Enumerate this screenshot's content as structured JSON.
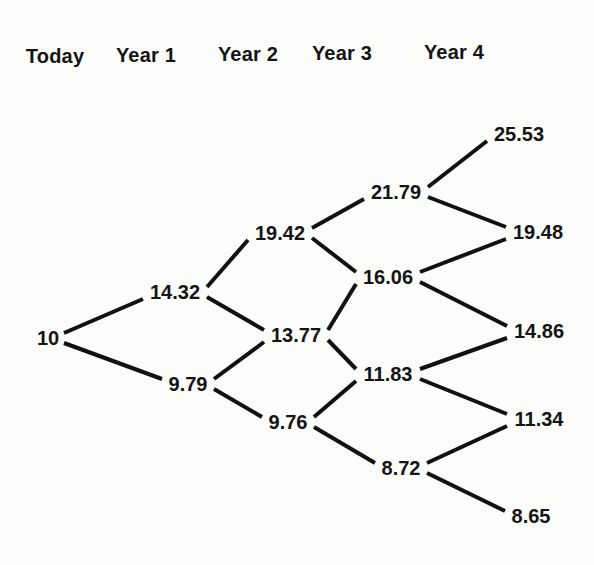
{
  "figure": {
    "background_color": "#fcfcfb",
    "line_color": "#111111",
    "text_color": "#141414",
    "line_width": 4
  },
  "columns": [
    {
      "label": "Today",
      "x": 55,
      "y": 56
    },
    {
      "label": "Year 1",
      "x": 146,
      "y": 55
    },
    {
      "label": "Year 2",
      "x": 248,
      "y": 54
    },
    {
      "label": "Year 3",
      "x": 342,
      "y": 53
    },
    {
      "label": "Year 4",
      "x": 454,
      "y": 52
    }
  ],
  "tree": {
    "type": "recombining-binomial-lattice",
    "root_value": 10,
    "values_by_period": [
      [
        10
      ],
      [
        14.32,
        9.79
      ],
      [
        19.42,
        13.77,
        9.76
      ],
      [
        21.79,
        16.06,
        11.83,
        8.72
      ],
      [
        25.53,
        19.48,
        14.86,
        11.34,
        8.65
      ]
    ],
    "nodes": [
      {
        "id": "t0",
        "label": "10",
        "period": 0,
        "x": 48,
        "y": 338,
        "hw": 13
      },
      {
        "id": "n1u",
        "label": "14.32",
        "period": 1,
        "x": 175,
        "y": 292,
        "hw": 29
      },
      {
        "id": "n1d",
        "label": "9.79",
        "period": 1,
        "x": 188,
        "y": 384,
        "hw": 23
      },
      {
        "id": "n2u",
        "label": "19.42",
        "period": 2,
        "x": 280,
        "y": 233,
        "hw": 29
      },
      {
        "id": "n2m",
        "label": "13.77",
        "period": 2,
        "x": 296,
        "y": 335,
        "hw": 29
      },
      {
        "id": "n2d",
        "label": "9.76",
        "period": 2,
        "x": 288,
        "y": 422,
        "hw": 23
      },
      {
        "id": "n3a",
        "label": "21.79",
        "period": 3,
        "x": 396,
        "y": 192,
        "hw": 29
      },
      {
        "id": "n3b",
        "label": "16.06",
        "period": 3,
        "x": 388,
        "y": 277,
        "hw": 29
      },
      {
        "id": "n3c",
        "label": "11.83",
        "period": 3,
        "x": 388,
        "y": 374,
        "hw": 29
      },
      {
        "id": "n3d",
        "label": "8.72",
        "period": 3,
        "x": 401,
        "y": 468,
        "hw": 23
      },
      {
        "id": "n4a",
        "label": "25.53",
        "period": 4,
        "x": 519,
        "y": 134,
        "hw": 29
      },
      {
        "id": "n4b",
        "label": "19.48",
        "period": 4,
        "x": 538,
        "y": 232,
        "hw": 29
      },
      {
        "id": "n4c",
        "label": "14.86",
        "period": 4,
        "x": 539,
        "y": 331,
        "hw": 29
      },
      {
        "id": "n4d",
        "label": "11.34",
        "period": 4,
        "x": 539,
        "y": 419,
        "hw": 29
      },
      {
        "id": "n4e",
        "label": "8.65",
        "period": 4,
        "x": 531,
        "y": 516,
        "hw": 23
      }
    ],
    "edges": [
      [
        "t0",
        "n1u"
      ],
      [
        "t0",
        "n1d"
      ],
      [
        "n1u",
        "n2u"
      ],
      [
        "n1u",
        "n2m"
      ],
      [
        "n1d",
        "n2m"
      ],
      [
        "n1d",
        "n2d"
      ],
      [
        "n2u",
        "n3a"
      ],
      [
        "n2u",
        "n3b"
      ],
      [
        "n2m",
        "n3b"
      ],
      [
        "n2m",
        "n3c"
      ],
      [
        "n2d",
        "n3c"
      ],
      [
        "n2d",
        "n3d"
      ],
      [
        "n3a",
        "n4a"
      ],
      [
        "n3a",
        "n4b"
      ],
      [
        "n3b",
        "n4b"
      ],
      [
        "n3b",
        "n4c"
      ],
      [
        "n3c",
        "n4c"
      ],
      [
        "n3c",
        "n4d"
      ],
      [
        "n3d",
        "n4d"
      ],
      [
        "n3d",
        "n4e"
      ]
    ]
  }
}
